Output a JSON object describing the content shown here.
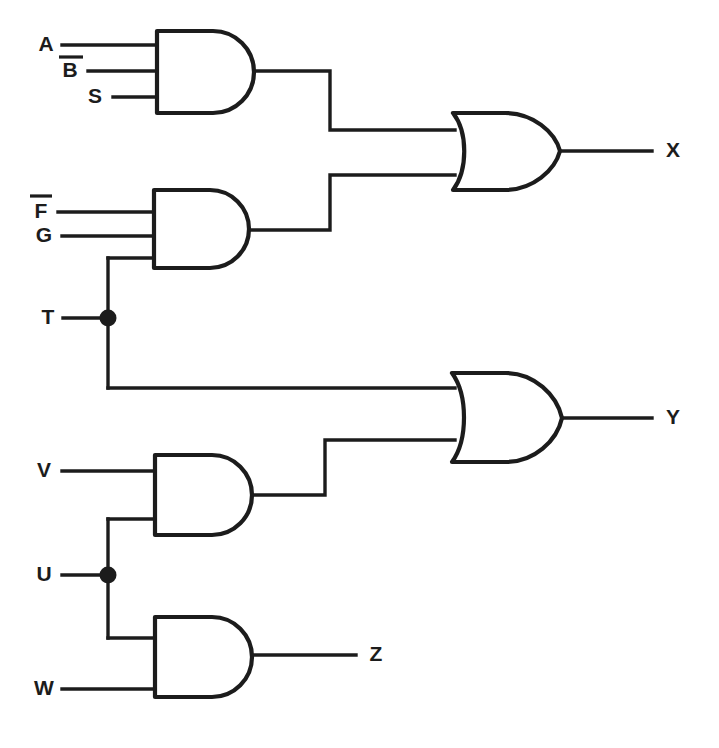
{
  "diagram": {
    "ink_color": "#1c1c1c",
    "background_color": "#ffffff",
    "inputs": [
      {
        "id": "A",
        "label": "A",
        "overbar": false,
        "x": 46,
        "y": 45
      },
      {
        "id": "B",
        "label": "B",
        "overbar": true,
        "x": 70,
        "y": 70
      },
      {
        "id": "S",
        "label": "S",
        "overbar": false,
        "x": 95,
        "y": 97
      },
      {
        "id": "F",
        "label": "F",
        "overbar": true,
        "x": 41,
        "y": 211
      },
      {
        "id": "G",
        "label": "G",
        "overbar": false,
        "x": 44,
        "y": 236
      },
      {
        "id": "T",
        "label": "T",
        "overbar": false,
        "x": 48,
        "y": 318
      },
      {
        "id": "V",
        "label": "V",
        "overbar": false,
        "x": 44,
        "y": 471
      },
      {
        "id": "U",
        "label": "U",
        "overbar": false,
        "x": 44,
        "y": 575
      },
      {
        "id": "W",
        "label": "W",
        "overbar": false,
        "x": 44,
        "y": 689
      }
    ],
    "outputs": [
      {
        "id": "X",
        "label": "X",
        "x": 673,
        "y": 151
      },
      {
        "id": "Y",
        "label": "Y",
        "x": 673,
        "y": 418
      },
      {
        "id": "Z",
        "label": "Z",
        "x": 376,
        "y": 655
      }
    ],
    "gates": [
      {
        "id": "and1",
        "type": "AND",
        "inputs": [
          "A",
          "B",
          "S"
        ],
        "output_to": "or_x",
        "num_inputs": 3
      },
      {
        "id": "and2",
        "type": "AND",
        "inputs": [
          "F",
          "G",
          "T"
        ],
        "output_to": "or_x",
        "num_inputs": 3
      },
      {
        "id": "or_x",
        "type": "OR",
        "inputs": [
          "and1",
          "and2"
        ],
        "output_to": "X",
        "num_inputs": 2
      },
      {
        "id": "and3",
        "type": "AND",
        "inputs": [
          "V",
          "U"
        ],
        "output_to": "or_y",
        "num_inputs": 2
      },
      {
        "id": "or_y",
        "type": "OR",
        "inputs": [
          "T",
          "and3"
        ],
        "output_to": "Y",
        "num_inputs": 2
      },
      {
        "id": "and4",
        "type": "AND",
        "inputs": [
          "U",
          "W"
        ],
        "output_to": "Z",
        "num_inputs": 2
      }
    ],
    "junctions": [
      {
        "id": "junction-T",
        "signal": "T",
        "x": 108,
        "y": 318
      },
      {
        "id": "junction-U",
        "signal": "U",
        "x": 108,
        "y": 575
      }
    ],
    "equations": {
      "X": "A·B̄·S + F̄·G·T",
      "Y": "T + V·U",
      "Z": "U·W"
    }
  }
}
